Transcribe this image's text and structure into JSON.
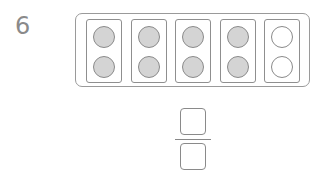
{
  "problem": {
    "number": "6",
    "ten_frame": {
      "columns": 5,
      "rows": 2,
      "filled_count": 8,
      "total_count": 10,
      "cells": [
        {
          "top": "filled",
          "bottom": "filled"
        },
        {
          "top": "filled",
          "bottom": "filled"
        },
        {
          "top": "filled",
          "bottom": "filled"
        },
        {
          "top": "filled",
          "bottom": "filled"
        },
        {
          "top": "empty",
          "bottom": "empty"
        }
      ],
      "fill_color": "#d4d4d4"
    },
    "fraction": {
      "numerator": "",
      "denominator": ""
    }
  }
}
